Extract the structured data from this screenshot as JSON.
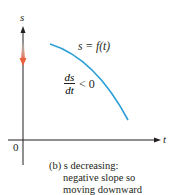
{
  "diagram": {
    "axes": {
      "vertical_label": "s",
      "horizontal_label": "t",
      "origin_label": "0"
    },
    "curve": {
      "label": "s = f(t)",
      "color": "#2a9fd6",
      "description": "concave-down decreasing curve"
    },
    "derivative_annotation": {
      "numerator": "ds",
      "denominator": "dt",
      "relation": "< 0"
    },
    "direction_arrow": {
      "meaning": "moving downward",
      "color": "#e8603c"
    },
    "caption": {
      "line1": "(b) s decreasing:",
      "line2": "negative slope so",
      "line3": "moving downward"
    }
  },
  "colors": {
    "axis": "#231f20",
    "curve": "#2a9fd6",
    "arrow": "#e8603c"
  }
}
